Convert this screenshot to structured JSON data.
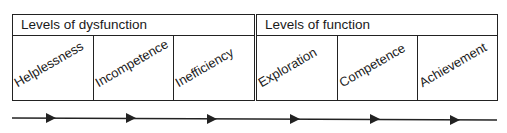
{
  "groups": [
    {
      "title": "Levels of dysfunction",
      "items": [
        {
          "label": "Helplessness"
        },
        {
          "label": "Incompetence"
        },
        {
          "label": "Inefficiency"
        }
      ]
    },
    {
      "title": "Levels of function",
      "items": [
        {
          "label": "Exploration"
        },
        {
          "label": "Competence"
        },
        {
          "label": "Achievement"
        }
      ]
    }
  ],
  "arrow": {
    "direction": "right",
    "arrowheads": 6
  }
}
